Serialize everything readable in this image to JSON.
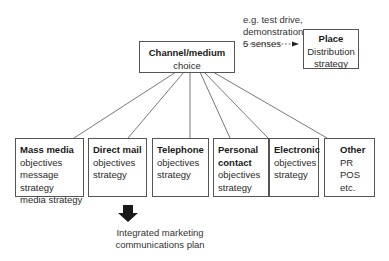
{
  "diagram": {
    "root": {
      "title": "Channel/medium",
      "subtitle": "choice"
    },
    "annotation": [
      "e.g. test drive,",
      "demonstration,",
      "5 senses"
    ],
    "place": {
      "title": "Place",
      "lines": [
        "Distribution",
        "strategy"
      ]
    },
    "channels": [
      {
        "title": "Mass media",
        "lines": [
          "objectives",
          "message strategy",
          "media strategy"
        ]
      },
      {
        "title": "Direct mail",
        "lines": [
          "objectives",
          "strategy"
        ]
      },
      {
        "title": "Telephone",
        "lines": [
          "objectives",
          "strategy"
        ]
      },
      {
        "title": "Personal contact",
        "title_lines": [
          "Personal",
          "contact"
        ],
        "lines": [
          "objectives",
          "strategy"
        ]
      },
      {
        "title": "Electronic",
        "lines": [
          "objectives",
          "strategy"
        ]
      },
      {
        "title": "Other",
        "lines": [
          "PR",
          "POS",
          "etc."
        ]
      }
    ],
    "result": [
      "Integrated marketing",
      "communications plan"
    ],
    "colors": {
      "line": "#555555",
      "arrow": "#1a1a1a",
      "text": "#2a2a2a"
    }
  }
}
